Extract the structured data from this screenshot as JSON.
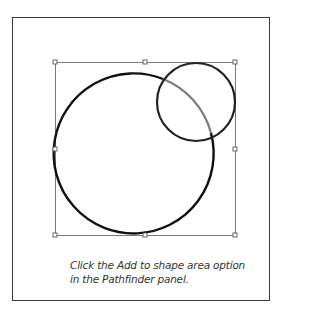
{
  "figure": {
    "frame": {
      "stroke": "#3a3a3a"
    },
    "bounding_box": {
      "x": 55,
      "y": 62,
      "width": 180,
      "height": 173,
      "stroke": "#7a7a7a"
    },
    "handles": [
      {
        "name": "top-left",
        "x": 55,
        "y": 62
      },
      {
        "name": "top-center",
        "x": 145,
        "y": 62
      },
      {
        "name": "top-right",
        "x": 235,
        "y": 62
      },
      {
        "name": "middle-left",
        "x": 55,
        "y": 149
      },
      {
        "name": "middle-right",
        "x": 235,
        "y": 149
      },
      {
        "name": "bottom-left",
        "x": 55,
        "y": 235
      },
      {
        "name": "bottom-center",
        "x": 145,
        "y": 235
      },
      {
        "name": "bottom-right",
        "x": 235,
        "y": 235
      }
    ],
    "shapes": [
      {
        "name": "large-circle",
        "cx": 134,
        "cy": 154,
        "r": 80,
        "stroke": "#111111"
      },
      {
        "name": "small-circle",
        "cx": 196,
        "cy": 102,
        "r": 39,
        "stroke": "#222222"
      },
      {
        "name": "overlap-arc",
        "stroke": "#7d7d7d"
      }
    ]
  },
  "caption": {
    "line1": "Click the Add to shape area option",
    "line2": "in the Pathfinder panel."
  }
}
